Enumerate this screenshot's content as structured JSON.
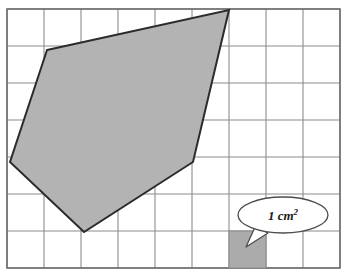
{
  "figure": {
    "background_color": "#ffffff",
    "grid": {
      "origin_x": 7,
      "origin_y": 9,
      "cell_size": 37,
      "columns": 9,
      "rows": 7,
      "line_color": "#8c8c8c",
      "border_color": "#6e6e6e",
      "line_width": 1.1,
      "border_width": 1.6
    },
    "polygon": {
      "name": "shaded-polygon",
      "fill_color": "#b3b3b3",
      "stroke_color": "#2b2b2b",
      "stroke_width": 2,
      "vertices": [
        {
          "x": 47,
          "y": 50
        },
        {
          "x": 229,
          "y": 10
        },
        {
          "x": 193,
          "y": 162
        },
        {
          "x": 84,
          "y": 232
        },
        {
          "x": 10,
          "y": 162
        }
      ],
      "vertices_path": "47,50 229,10 193,162 84,232 10,162"
    },
    "unit_square": {
      "name": "unit-square-swatch",
      "x": 229,
      "y": 231,
      "width": 37,
      "height": 37,
      "fill_color": "#ababab",
      "stroke_color": "#8c8c8c"
    },
    "callout": {
      "label": "1 cm",
      "exponent": "2",
      "full_label": "1 cm²",
      "bubble": {
        "center_x": 283,
        "center_y": 215,
        "radius_x": 45,
        "radius_y": 18,
        "fill_color": "#ffffff",
        "stroke_color": "#4d4d4d",
        "stroke_width": 1.3
      },
      "tail_path": "M 255 227 L 246 247 L 268 233 Z"
    }
  }
}
